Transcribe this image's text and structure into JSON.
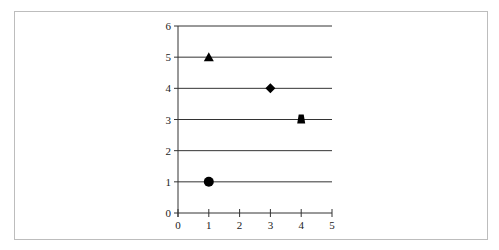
{
  "chart_data": {
    "type": "scatter",
    "title": "",
    "xlabel": "",
    "ylabel": "",
    "xlim": [
      0,
      5
    ],
    "ylim": [
      0,
      6
    ],
    "x_ticks": [
      "0",
      "1",
      "2",
      "3",
      "4",
      "5"
    ],
    "y_ticks": [
      "0",
      "1",
      "2",
      "3",
      "4",
      "5",
      "6"
    ],
    "grid": "horizontal",
    "legend": null,
    "points": [
      {
        "x": 1,
        "y": 5,
        "marker": "triangle"
      },
      {
        "x": 3,
        "y": 4,
        "marker": "diamond"
      },
      {
        "x": 4,
        "y": 3,
        "marker": "trapezoid"
      },
      {
        "x": 1,
        "y": 1,
        "marker": "circle"
      }
    ],
    "colors": {
      "marker": "#000000",
      "grid": "#333333",
      "frame": "#bdbdbd"
    }
  }
}
